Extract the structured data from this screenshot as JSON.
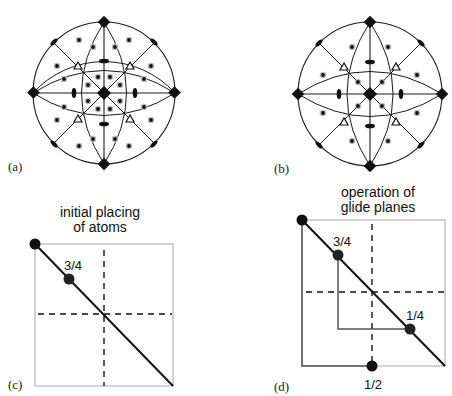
{
  "panels": {
    "a": {
      "label": "(a)",
      "type": "stereographic-projection",
      "center": [
        104,
        93
      ],
      "radius": 71,
      "general_positions_count": 48
    },
    "b": {
      "label": "(b)",
      "type": "stereographic-projection",
      "center": [
        370,
        94
      ],
      "radius": 72,
      "general_positions_count": 24
    },
    "c": {
      "label": "(c)",
      "caption_line1": "initial placing",
      "caption_line2": "of atoms",
      "fractions": [
        "3/4"
      ]
    },
    "d": {
      "label": "(d)",
      "caption_line1": "operation of",
      "caption_line2": "glide planes",
      "fractions": [
        "3/4",
        "1/4",
        "1/2"
      ]
    }
  },
  "colors": {
    "line": "#1a1a1a",
    "square_border": "#a8a8a8",
    "glide_path": "#555555",
    "atom": "#111111",
    "pole_halo": "#bdbdbd"
  }
}
